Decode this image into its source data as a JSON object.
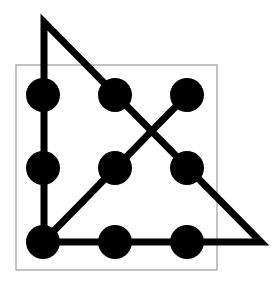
{
  "diagram": {
    "colors": {
      "background": "#ffffff",
      "dot": "#000000",
      "path": "#000000",
      "box": "#9a9a9a"
    },
    "box": {
      "x": 16,
      "y": 65,
      "width": 201,
      "height": 205
    },
    "dot_radius": 17,
    "dots": [
      {
        "id": "r1c1",
        "cx": 43,
        "cy": 95
      },
      {
        "id": "r1c2",
        "cx": 115,
        "cy": 95
      },
      {
        "id": "r1c3",
        "cx": 187,
        "cy": 95
      },
      {
        "id": "r2c1",
        "cx": 43,
        "cy": 168
      },
      {
        "id": "r2c2",
        "cx": 115,
        "cy": 168
      },
      {
        "id": "r2c3",
        "cx": 187,
        "cy": 168
      },
      {
        "id": "r3c1",
        "cx": 43,
        "cy": 242
      },
      {
        "id": "r3c2",
        "cx": 115,
        "cy": 242
      },
      {
        "id": "r3c3",
        "cx": 187,
        "cy": 242
      }
    ],
    "path_points": [
      [
        187,
        95
      ],
      [
        43,
        242
      ],
      [
        261,
        242
      ],
      [
        44,
        22
      ],
      [
        44,
        242
      ]
    ],
    "path_width": 7
  }
}
